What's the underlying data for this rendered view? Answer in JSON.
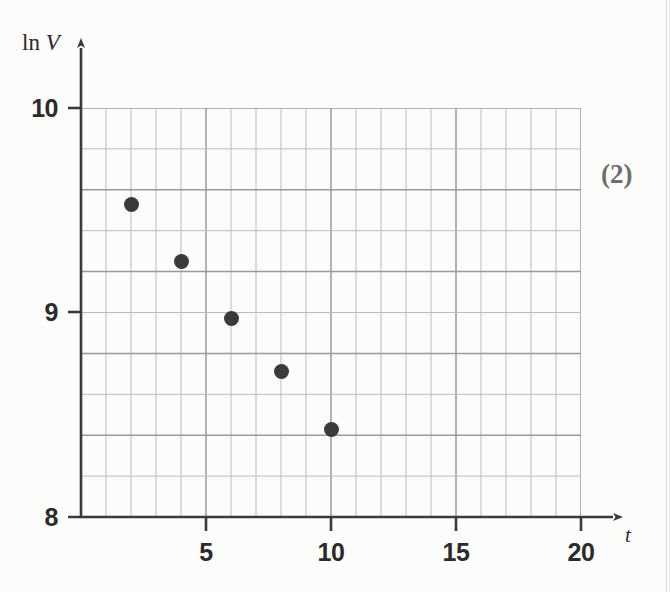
{
  "figure": {
    "annotation": "(2)",
    "background_color": "#fcfcfa",
    "grid_color": "#9a9a9a",
    "minor_grid_color": "#bcbcbc",
    "axis_color": "#3a3a3a",
    "point_color": "#3a3a3a"
  },
  "axes": {
    "y_title_prefix": "ln",
    "y_title_var": "V",
    "x_title": "t",
    "y_ticks": [
      "10",
      "9",
      "8"
    ],
    "x_ticks": [
      "5",
      "10",
      "15",
      "20"
    ]
  },
  "chart_data": {
    "type": "scatter",
    "title": "",
    "xlabel": "t",
    "ylabel": "ln V",
    "x": [
      2,
      4,
      6,
      8,
      10
    ],
    "y": [
      9.53,
      9.25,
      8.97,
      8.71,
      8.43
    ],
    "series": [
      {
        "name": "ln V vs t",
        "points": [
          {
            "x": 2,
            "y": 9.53
          },
          {
            "x": 4,
            "y": 9.25
          },
          {
            "x": 6,
            "y": 8.97
          },
          {
            "x": 8,
            "y": 8.71
          },
          {
            "x": 10,
            "y": 8.43
          }
        ]
      }
    ],
    "xlim": [
      0,
      20
    ],
    "ylim": [
      8,
      10
    ],
    "x_tick_values": [
      5,
      10,
      15,
      20
    ],
    "y_tick_values": [
      8,
      9,
      10
    ],
    "x_gridline_step": 1,
    "y_gridline_step": 0.2,
    "grid": true,
    "legend": "none",
    "annotations": [
      {
        "text": "(2)",
        "position": "right-margin"
      }
    ]
  }
}
